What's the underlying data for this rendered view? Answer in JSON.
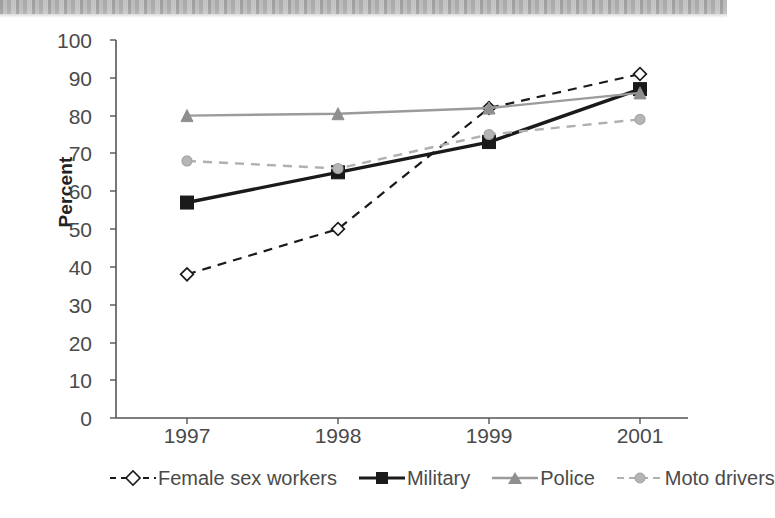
{
  "chart_data": {
    "type": "line",
    "title": "",
    "xlabel": "",
    "ylabel": "Percent",
    "categories": [
      "1997",
      "1998",
      "1999",
      "2001"
    ],
    "ylim": [
      0,
      100
    ],
    "ytick_step": 10,
    "yticks": [
      "100",
      "90",
      "80",
      "70",
      "60",
      "50",
      "40",
      "30",
      "20",
      "10",
      "0"
    ],
    "grid": false,
    "legend_position": "bottom",
    "series": [
      {
        "name": "Female sex workers",
        "values": [
          38,
          50,
          82,
          91
        ],
        "color": "#1a1a1a",
        "line_style": "dashed",
        "marker": "diamond-open"
      },
      {
        "name": "Military",
        "values": [
          57,
          65,
          73,
          87
        ],
        "color": "#1a1a1a",
        "line_style": "solid",
        "marker": "square-filled"
      },
      {
        "name": "Police",
        "values": [
          80,
          80.5,
          82,
          86
        ],
        "color": "#9b9b9b",
        "line_style": "solid",
        "marker": "triangle-filled"
      },
      {
        "name": "Moto drivers",
        "values": [
          68,
          66,
          75,
          79
        ],
        "color": "#b0b0b0",
        "line_style": "dashed",
        "marker": "circle-filled"
      }
    ]
  },
  "axes": {
    "y_title": "Percent"
  },
  "colors": {
    "axis": "#555555",
    "tick_text": "#4a4a4a",
    "series_dark": "#1a1a1a",
    "series_gray": "#9b9b9b",
    "series_light_gray": "#b0b0b0",
    "scan_bar": "#bcbcbc"
  }
}
